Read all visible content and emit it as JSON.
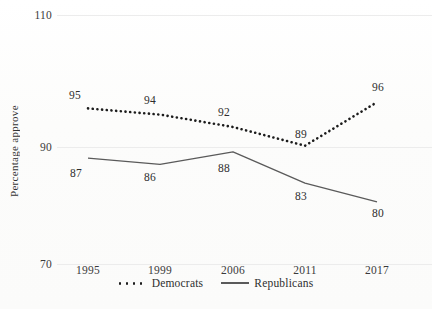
{
  "chart_data": {
    "type": "line",
    "title": "",
    "xlabel": "",
    "ylabel": "Percentage approve",
    "categories": [
      "1995",
      "1999",
      "2006",
      "2011",
      "2017"
    ],
    "ylim": [
      70,
      110
    ],
    "yticks": [
      70,
      90,
      110
    ],
    "grid": true,
    "legend_position": "bottom",
    "series": [
      {
        "name": "Democrats",
        "style": "dotted",
        "color": "#1c1c1c",
        "values": [
          95,
          94,
          92,
          89,
          96
        ],
        "labels": [
          "95",
          "94",
          "92",
          "89",
          "96"
        ]
      },
      {
        "name": "Republicans",
        "style": "solid",
        "color": "#5a5a5a",
        "values": [
          87,
          86,
          88,
          83,
          80
        ],
        "labels": [
          "87",
          "86",
          "88",
          "83",
          "80"
        ]
      }
    ]
  },
  "axis": {
    "y_title": "Percentage approve",
    "y_tick_labels": [
      "110",
      "90",
      "70"
    ],
    "x_tick_labels": [
      "1995",
      "1999",
      "2006",
      "2011",
      "2017"
    ]
  },
  "legend": {
    "entries": [
      {
        "label": "Democrats"
      },
      {
        "label": "Republicans"
      }
    ]
  }
}
